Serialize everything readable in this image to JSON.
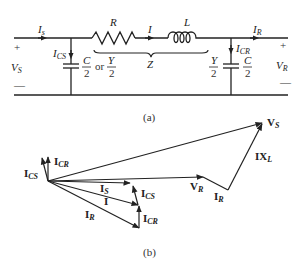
{
  "circuit": {
    "caption": "(a)",
    "labels": {
      "Is": "I",
      "Is_sub": "s",
      "R": "R",
      "I": "I",
      "L": "L",
      "IR": "I",
      "IR_sub": "R",
      "Z": "Z",
      "ICS": "I",
      "ICS_sub": "CS",
      "ICR": "I",
      "ICR_sub": "CR",
      "VS": "V",
      "VS_sub": "S",
      "VR": "V",
      "VR_sub": "R",
      "plus": "+",
      "minus": "—",
      "C": "C",
      "Y": "Y",
      "two": "2",
      "or": "or"
    }
  },
  "phasor": {
    "caption": "(b)",
    "labels": {
      "VS": "V",
      "VS_sub": "S",
      "IXL": "IX",
      "IXL_sub": "L",
      "VR": "V",
      "VR_sub": "R",
      "IR_tip": "I",
      "IR_tip_sub": "R",
      "ICS": "I",
      "ICS_sub": "CS",
      "ICR": "I",
      "ICR_sub": "CR",
      "Is": "I",
      "Is_sub": "S",
      "I": "I",
      "IR": "I",
      "IR_sub": "R",
      "ICS2": "I",
      "ICS2_sub": "CS",
      "ICR2": "I",
      "ICR2_sub": "CR"
    }
  }
}
